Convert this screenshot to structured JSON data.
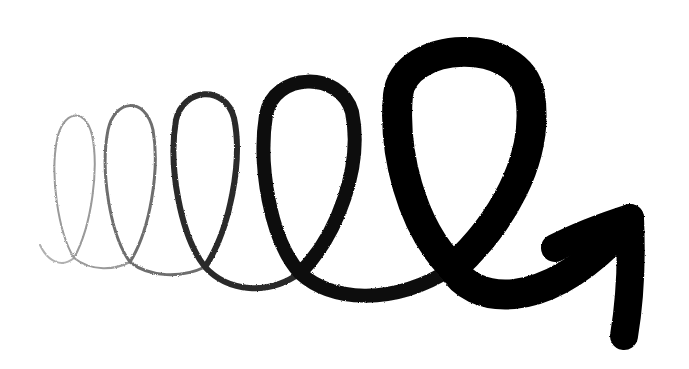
{
  "canvas": {
    "width": 689,
    "height": 369,
    "background": "#ffffff"
  },
  "illustration": {
    "subject": "spiral-coil-arrow",
    "description": "Hand-drawn spring coil of five loops growing in size and stroke weight from left to right, ending in an arrow pointing up-right",
    "loops": [
      {
        "index": 1,
        "color": "#9a9a9a",
        "stroke_width": 2
      },
      {
        "index": 2,
        "color": "#6e6e6e",
        "stroke_width": 3
      },
      {
        "index": 3,
        "color": "#2a2a2a",
        "stroke_width": 6
      },
      {
        "index": 4,
        "color": "#0d0d0d",
        "stroke_width": 14
      },
      {
        "index": 5,
        "color": "#000000",
        "stroke_width": 30
      }
    ],
    "arrow": {
      "color": "#000000",
      "stroke_width": 28,
      "direction": "up-right"
    }
  }
}
